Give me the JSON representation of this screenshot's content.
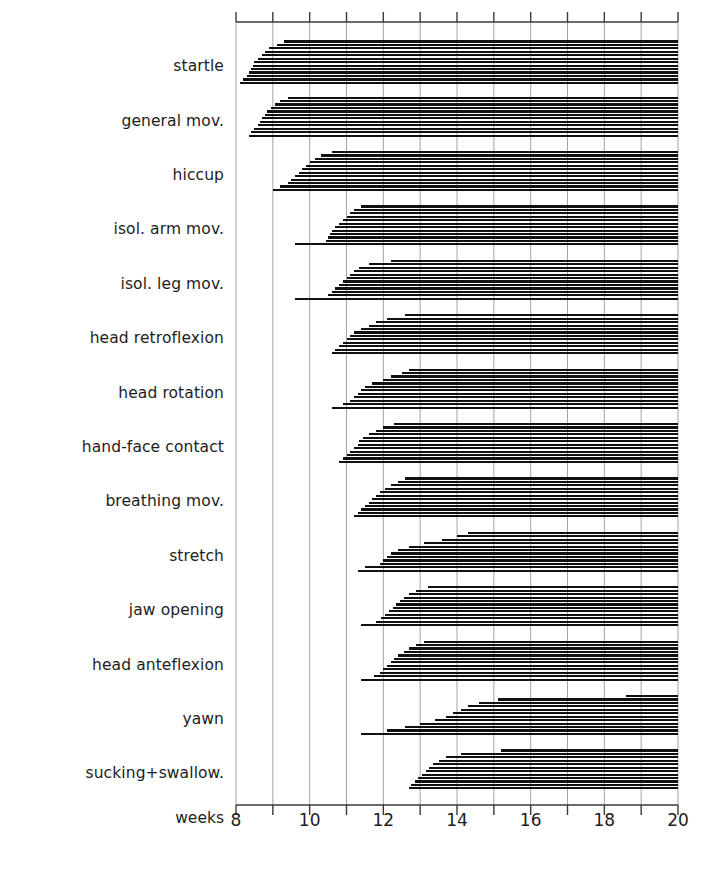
{
  "figure": {
    "axis_label": "weeks",
    "x_axis": {
      "min": 8,
      "max": 20,
      "tick_step": 1,
      "labeled_ticks": [
        8,
        10,
        12,
        14,
        16,
        18,
        20
      ],
      "tick_labels": [
        "8",
        "10",
        "12",
        "14",
        "16",
        "18",
        "20"
      ]
    },
    "line_color": "#111111",
    "axis_color": "#3a3a3a",
    "grid_color": "#9a9a9a",
    "background": "#ffffff"
  },
  "chart_data": {
    "type": "bar",
    "title": "",
    "xlabel": "weeks",
    "ylabel": "",
    "xlim": [
      8,
      20
    ],
    "grid": true,
    "legend": "none",
    "note": "Each category row contains individually-observed fetuses; every bar starts at the week of first observation of that movement pattern and runs to the end of observation (week 20).",
    "categories": [
      "startle",
      "general mov.",
      "hiccup",
      "isol. arm mov.",
      "isol. leg mov.",
      "head retroflexion",
      "head rotation",
      "hand-face contact",
      "breathing mov.",
      "stretch",
      "jaw opening",
      "head anteflexion",
      "yawn",
      "sucking+swallow."
    ],
    "series": [
      {
        "name": "startle",
        "end": 20,
        "onsets": [
          9.3,
          9.1,
          8.9,
          8.8,
          8.7,
          8.6,
          8.5,
          8.45,
          8.4,
          8.35,
          8.3,
          8.2,
          8.1
        ]
      },
      {
        "name": "general mov.",
        "end": 20,
        "onsets": [
          9.4,
          9.2,
          9.05,
          8.95,
          8.85,
          8.8,
          8.7,
          8.65,
          8.6,
          8.5,
          8.4,
          8.35
        ]
      },
      {
        "name": "hiccup",
        "end": 20,
        "onsets": [
          10.6,
          10.3,
          10.15,
          10.0,
          9.9,
          9.8,
          9.7,
          9.6,
          9.5,
          9.4,
          9.2,
          9.0
        ]
      },
      {
        "name": "isol. arm mov.",
        "end": 20,
        "onsets": [
          11.4,
          11.2,
          11.1,
          11.0,
          10.9,
          10.8,
          10.7,
          10.6,
          10.55,
          10.5,
          10.45,
          9.6
        ]
      },
      {
        "name": "isol. leg mov.",
        "end": 20,
        "onsets": [
          12.2,
          11.6,
          11.35,
          11.2,
          11.1,
          11.0,
          10.9,
          10.8,
          10.7,
          10.6,
          10.5,
          9.6
        ]
      },
      {
        "name": "head retroflexion",
        "end": 20,
        "onsets": [
          12.6,
          12.1,
          11.8,
          11.6,
          11.4,
          11.2,
          11.1,
          11.0,
          10.9,
          10.8,
          10.7,
          10.6
        ]
      },
      {
        "name": "head rotation",
        "end": 20,
        "onsets": [
          12.7,
          12.5,
          12.2,
          12.0,
          11.7,
          11.5,
          11.4,
          11.3,
          11.2,
          11.1,
          10.9,
          10.6
        ]
      },
      {
        "name": "hand-face contact",
        "end": 20,
        "onsets": [
          12.3,
          12.0,
          11.8,
          11.6,
          11.45,
          11.35,
          11.3,
          11.2,
          11.1,
          11.0,
          10.9,
          10.8
        ]
      },
      {
        "name": "breathing mov.",
        "end": 20,
        "onsets": [
          12.6,
          12.4,
          12.2,
          12.05,
          11.9,
          11.8,
          11.7,
          11.6,
          11.5,
          11.4,
          11.3,
          11.2
        ]
      },
      {
        "name": "stretch",
        "end": 20,
        "onsets": [
          14.3,
          14.0,
          13.6,
          13.1,
          12.7,
          12.4,
          12.2,
          12.1,
          12.0,
          11.9,
          11.5,
          11.3
        ]
      },
      {
        "name": "jaw opening",
        "end": 20,
        "onsets": [
          13.2,
          12.9,
          12.7,
          12.55,
          12.45,
          12.35,
          12.25,
          12.15,
          12.05,
          11.95,
          11.8,
          11.4
        ]
      },
      {
        "name": "head anteflexion",
        "end": 20,
        "onsets": [
          13.1,
          12.9,
          12.7,
          12.55,
          12.4,
          12.3,
          12.2,
          12.1,
          12.0,
          11.9,
          11.75,
          11.4
        ]
      },
      {
        "name": "yawn",
        "end": 20,
        "onsets": [
          18.6,
          15.1,
          14.6,
          14.3,
          14.1,
          13.9,
          13.7,
          13.4,
          13.0,
          12.6,
          12.1,
          11.4
        ]
      },
      {
        "name": "sucking+swallow.",
        "end": 20,
        "onsets": [
          15.2,
          14.1,
          13.7,
          13.5,
          13.35,
          13.25,
          13.15,
          13.05,
          12.95,
          12.85,
          12.75,
          12.7
        ]
      }
    ]
  }
}
